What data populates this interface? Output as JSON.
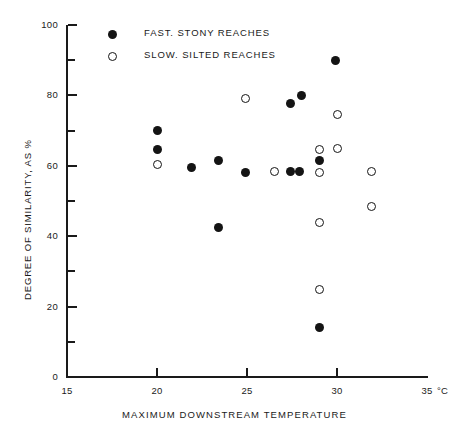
{
  "chart_data": {
    "type": "scatter",
    "title": "",
    "xlabel": "MAXIMUM DOWNSTREAM TEMPERATURE",
    "ylabel": "DEGREE OF SIMILARITY, AS %",
    "x_unit": "°C",
    "xlim": [
      15,
      35
    ],
    "ylim": [
      0,
      100
    ],
    "x_ticks": [
      15,
      20,
      25,
      30,
      35
    ],
    "x_tick_labels": [
      "15",
      "20",
      "25",
      "30",
      "35"
    ],
    "y_ticks": [
      0,
      20,
      40,
      60,
      80,
      100
    ],
    "y_tick_labels": [
      "0",
      "20",
      "40",
      "60",
      "80",
      "100"
    ],
    "y_minor_ticks": [
      10,
      30,
      50,
      70,
      90
    ],
    "grid": false,
    "legend_position": "top-left-inside",
    "series": [
      {
        "name": "FAST, STONY REACHES",
        "marker": "filled-circle",
        "color": "#141414",
        "points": [
          {
            "x": 20.0,
            "y": 70.0
          },
          {
            "x": 20.0,
            "y": 64.5
          },
          {
            "x": 21.9,
            "y": 59.5
          },
          {
            "x": 23.4,
            "y": 61.5
          },
          {
            "x": 23.4,
            "y": 42.5
          },
          {
            "x": 24.9,
            "y": 58.0
          },
          {
            "x": 27.4,
            "y": 77.8
          },
          {
            "x": 28.0,
            "y": 80.0
          },
          {
            "x": 27.4,
            "y": 58.5
          },
          {
            "x": 27.9,
            "y": 58.5
          },
          {
            "x": 29.0,
            "y": 61.5
          },
          {
            "x": 29.9,
            "y": 90.0
          },
          {
            "x": 29.0,
            "y": 14.0
          }
        ]
      },
      {
        "name": "SLOW, SILTED REACHES",
        "marker": "open-circle",
        "color": "#141414",
        "points": [
          {
            "x": 20.0,
            "y": 60.5
          },
          {
            "x": 24.9,
            "y": 79.0
          },
          {
            "x": 26.5,
            "y": 58.5
          },
          {
            "x": 29.0,
            "y": 64.5
          },
          {
            "x": 29.0,
            "y": 58.0
          },
          {
            "x": 30.0,
            "y": 65.0
          },
          {
            "x": 30.0,
            "y": 74.5
          },
          {
            "x": 29.0,
            "y": 44.0
          },
          {
            "x": 29.0,
            "y": 25.0
          },
          {
            "x": 31.9,
            "y": 58.5
          },
          {
            "x": 31.9,
            "y": 48.5
          }
        ]
      }
    ],
    "legend": [
      {
        "label": "FAST. STONY REACHES",
        "marker": "filled-circle"
      },
      {
        "label": "SLOW. SILTED REACHES",
        "marker": "open-circle"
      }
    ]
  }
}
